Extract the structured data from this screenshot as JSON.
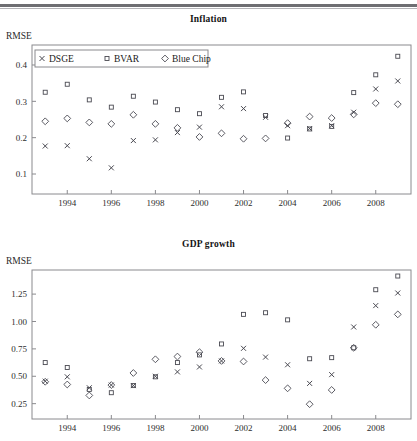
{
  "document": {
    "rule_color": "#6e6e72"
  },
  "panels": [
    {
      "id": "inflation",
      "title": "Inflation",
      "y_axis_name": "RMSE",
      "legend": {
        "entries": [
          {
            "label": "DSGE",
            "marker": "x"
          },
          {
            "label": "BVAR",
            "marker": "square"
          },
          {
            "label": "Blue Chip",
            "marker": "diamond"
          }
        ]
      },
      "chart_data": {
        "type": "scatter",
        "title": "Inflation",
        "xlabel": "",
        "ylabel": "RMSE",
        "grid": false,
        "legend_position": "top-left-inside",
        "xlim": [
          1992.4,
          2009.6
        ],
        "ylim": [
          0.045,
          0.455
        ],
        "x_ticks": [
          1994,
          1996,
          1998,
          2000,
          2002,
          2004,
          2006,
          2008
        ],
        "x_tick_labels": [
          "1994",
          "1996",
          "1998",
          "2000",
          "2002",
          "2004",
          "2006",
          "2008"
        ],
        "y_ticks": [
          0.1,
          0.2,
          0.3,
          0.4
        ],
        "y_tick_labels": [
          "0.1",
          "0.2",
          "0.3",
          "0.4"
        ],
        "x": [
          1993,
          1994,
          1995,
          1996,
          1997,
          1998,
          1999,
          2000,
          2001,
          2002,
          2003,
          2004,
          2005,
          2006,
          2007,
          2008,
          2009
        ],
        "series": [
          {
            "name": "DSGE",
            "marker": "x",
            "values": [
              0.177,
              0.178,
              0.142,
              0.117,
              0.192,
              0.194,
              0.214,
              0.229,
              0.285,
              0.28,
              0.256,
              0.233,
              0.225,
              0.233,
              0.27,
              0.334,
              0.356
            ]
          },
          {
            "name": "BVAR",
            "marker": "square",
            "values": [
              0.325,
              0.347,
              0.304,
              0.284,
              0.314,
              0.298,
              0.277,
              0.266,
              0.311,
              0.326,
              0.261,
              0.199,
              0.224,
              0.231,
              0.324,
              0.373,
              0.424
            ]
          },
          {
            "name": "Blue Chip",
            "marker": "diamond",
            "values": [
              0.245,
              0.253,
              0.242,
              0.238,
              0.263,
              0.238,
              0.227,
              0.202,
              0.212,
              0.197,
              0.198,
              0.24,
              0.258,
              0.254,
              0.264,
              0.295,
              0.292
            ]
          }
        ]
      }
    },
    {
      "id": "gdp-growth",
      "title": "GDP growth",
      "y_axis_name": "RMSE",
      "chart_data": {
        "type": "scatter",
        "title": "GDP growth",
        "xlabel": "",
        "ylabel": "RMSE",
        "grid": false,
        "legend_position": "none",
        "xlim": [
          1992.4,
          2009.6
        ],
        "ylim": [
          0.11,
          1.47
        ],
        "x_ticks": [
          1994,
          1996,
          1998,
          2000,
          2002,
          2004,
          2006,
          2008
        ],
        "x_tick_labels": [
          "1994",
          "1996",
          "1998",
          "2000",
          "2002",
          "2004",
          "2006",
          "2008"
        ],
        "y_ticks": [
          0.25,
          0.5,
          0.75,
          1.0,
          1.25
        ],
        "y_tick_labels": [
          "0.25",
          "0.50",
          "0.75",
          "1.00",
          "1.25"
        ],
        "x": [
          1993,
          1994,
          1995,
          1996,
          1997,
          1998,
          1999,
          2000,
          2001,
          2002,
          2003,
          2004,
          2005,
          2006,
          2007,
          2008,
          2009
        ],
        "series": [
          {
            "name": "DSGE",
            "marker": "x",
            "values": [
              0.455,
              0.495,
              0.395,
              0.42,
              0.415,
              0.5,
              0.54,
              0.585,
              0.64,
              0.755,
              0.675,
              0.605,
              0.435,
              0.515,
              0.95,
              1.145,
              1.26
            ]
          },
          {
            "name": "BVAR",
            "marker": "square",
            "values": [
              0.625,
              0.58,
              0.38,
              0.35,
              0.415,
              0.495,
              0.625,
              0.695,
              0.795,
              1.065,
              1.08,
              1.015,
              0.66,
              0.67,
              0.76,
              1.29,
              1.415
            ]
          },
          {
            "name": "Blue Chip",
            "marker": "diamond",
            "values": [
              0.45,
              0.425,
              0.325,
              0.42,
              0.53,
              0.655,
              0.68,
              0.72,
              0.64,
              0.635,
              0.465,
              0.39,
              0.245,
              0.375,
              0.76,
              0.97,
              1.065
            ]
          }
        ]
      }
    }
  ]
}
